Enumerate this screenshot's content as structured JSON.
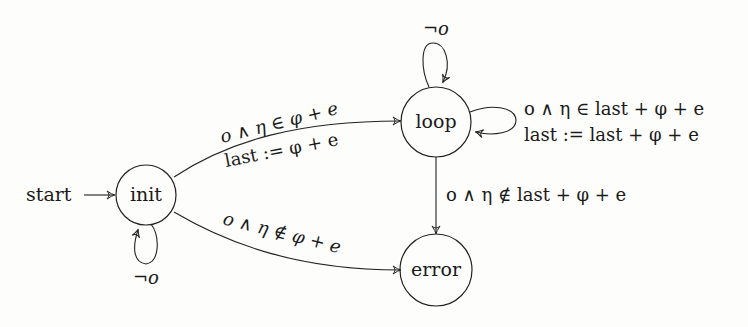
{
  "diagram": {
    "type": "state-machine",
    "start_label": "start",
    "states": [
      {
        "id": "init",
        "label": "init"
      },
      {
        "id": "loop",
        "label": "loop"
      },
      {
        "id": "error",
        "label": "error"
      }
    ],
    "transitions": [
      {
        "from": "start",
        "to": "init",
        "label": ""
      },
      {
        "from": "init",
        "to": "init",
        "label": "¬o"
      },
      {
        "from": "init",
        "to": "loop",
        "label_line1": "o ∧ η ∈ φ + e",
        "label_line2": "last := φ + e"
      },
      {
        "from": "init",
        "to": "error",
        "label": "o ∧ η ∉ φ + e"
      },
      {
        "from": "loop",
        "to": "loop",
        "label": "¬o",
        "position": "top"
      },
      {
        "from": "loop",
        "to": "loop",
        "label_line1": "o ∧ η ∈ last + φ + e",
        "label_line2": "last := last + φ + e",
        "position": "right"
      },
      {
        "from": "loop",
        "to": "error",
        "label": "o ∧ η ∉ last + φ + e"
      }
    ]
  }
}
